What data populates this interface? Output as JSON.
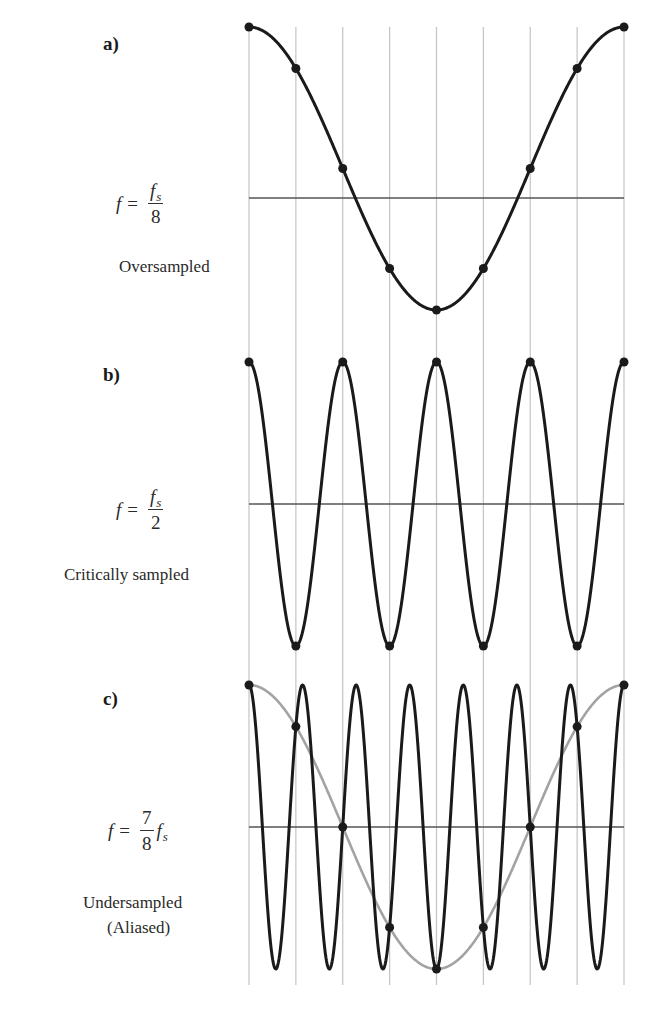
{
  "figure": {
    "panels": [
      {
        "id": "a",
        "label": "a)",
        "formula": {
          "lhs": "f",
          "eq": "=",
          "num": "f",
          "num_sub": "s",
          "den": "8"
        },
        "caption": [
          "Oversampled"
        ]
      },
      {
        "id": "b",
        "label": "b)",
        "formula": {
          "lhs": "f",
          "eq": "=",
          "num": "f",
          "num_sub": "s",
          "den": "2"
        },
        "caption": [
          "Critically sampled"
        ]
      },
      {
        "id": "c",
        "label": "c)",
        "formula": {
          "lhs": "f",
          "eq": "=",
          "num": "7",
          "den": "8",
          "tail": "f",
          "tail_sub": "s"
        },
        "caption": [
          "Undersampled",
          "(Aliased)"
        ]
      }
    ]
  },
  "chart_data": [
    {
      "type": "line",
      "title": "a) Oversampled, f = fs/8",
      "sample_index": [
        0,
        1,
        2,
        3,
        4,
        5,
        6,
        7,
        8
      ],
      "series": [
        {
          "name": "signal cos(2π·n/8)",
          "color": "#1a1a1a",
          "cycles_per_sample": 0.125,
          "samples": [
            1.0,
            0.707,
            0.0,
            -0.707,
            -1.0,
            -0.707,
            0.0,
            0.707,
            1.0
          ]
        }
      ],
      "grid": "vertical lines at each sample instant",
      "xlabel": "",
      "ylabel": "",
      "ylim": [
        -1,
        1
      ]
    },
    {
      "type": "line",
      "title": "b) Critically sampled, f = fs/2",
      "sample_index": [
        0,
        1,
        2,
        3,
        4,
        5,
        6,
        7,
        8
      ],
      "series": [
        {
          "name": "signal cos(2π·n/2)",
          "color": "#1a1a1a",
          "cycles_per_sample": 0.5,
          "samples": [
            1,
            -1,
            1,
            -1,
            1,
            -1,
            1,
            -1,
            1
          ]
        }
      ],
      "grid": "vertical lines at each sample instant",
      "xlabel": "",
      "ylabel": "",
      "ylim": [
        -1,
        1
      ]
    },
    {
      "type": "line",
      "title": "c) Undersampled (Aliased), f = 7/8 fs",
      "sample_index": [
        0,
        1,
        2,
        3,
        4,
        5,
        6,
        7,
        8
      ],
      "series": [
        {
          "name": "signal cos(2π·7n/8)",
          "color": "#1a1a1a",
          "cycles_per_sample": 0.875,
          "samples": [
            1.0,
            0.707,
            0.0,
            -0.707,
            -1.0,
            -0.707,
            0.0,
            0.707,
            1.0
          ]
        },
        {
          "name": "alias cos(2π·n/8)",
          "color": "#a0a0a0",
          "cycles_per_sample": 0.125,
          "samples": [
            1.0,
            0.707,
            0.0,
            -0.707,
            -1.0,
            -0.707,
            0.0,
            0.707,
            1.0
          ]
        }
      ],
      "grid": "vertical lines at each sample instant",
      "xlabel": "",
      "ylabel": "",
      "ylim": [
        -1,
        1
      ]
    }
  ],
  "layout": {
    "x0": 249,
    "x1": 624,
    "grid_top": 27,
    "grid_bottom": 985,
    "panels": [
      {
        "center": 168.5,
        "axis": 198,
        "amp": 141.5
      },
      {
        "center": 504,
        "axis": 504,
        "amp": 142
      },
      {
        "center": 827,
        "axis": 827,
        "amp": 142
      }
    ],
    "colors": {
      "curve": "#1a1a1a",
      "alias": "#a3a3a3",
      "grid": "#c4c4c4",
      "axis": "#555555",
      "dot": "#1a1a1a"
    }
  }
}
